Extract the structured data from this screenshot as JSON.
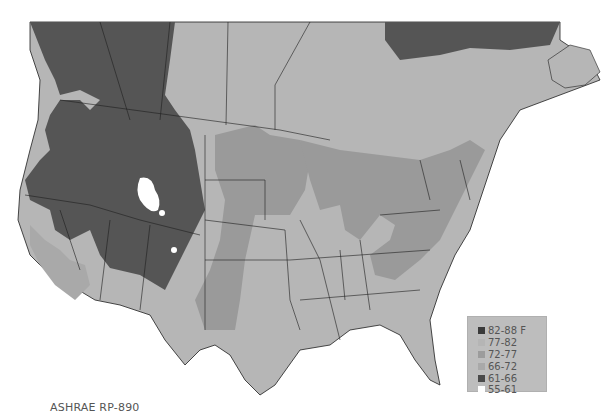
{
  "map": {
    "description": "Continental US and southern Canada shaded by design wet-bulb / dew-point temperature bins",
    "colors": {
      "background": "#ffffff",
      "bin_82_88": "#3a3a3a",
      "bin_77_82": "#b9b9b9",
      "bin_72_77": "#9a9a9a",
      "bin_66_72": "#a8a8a8",
      "bin_61_66": "#5a5a5a",
      "bin_55_61": "#ffffff",
      "boundaries": "#1e1e1e"
    }
  },
  "legend": {
    "items": [
      {
        "label": "82-88 F",
        "color": "#3a3a3a"
      },
      {
        "label": "77-82",
        "color": "#b5b5b5"
      },
      {
        "label": "72-77",
        "color": "#9c9c9c"
      },
      {
        "label": "66-72",
        "color": "#a9a9a9"
      },
      {
        "label": "61-66",
        "color": "#4a4a4a"
      },
      {
        "label": "55-61",
        "color": "#ffffff"
      }
    ]
  },
  "footer": {
    "source": "ASHRAE RP-890"
  }
}
